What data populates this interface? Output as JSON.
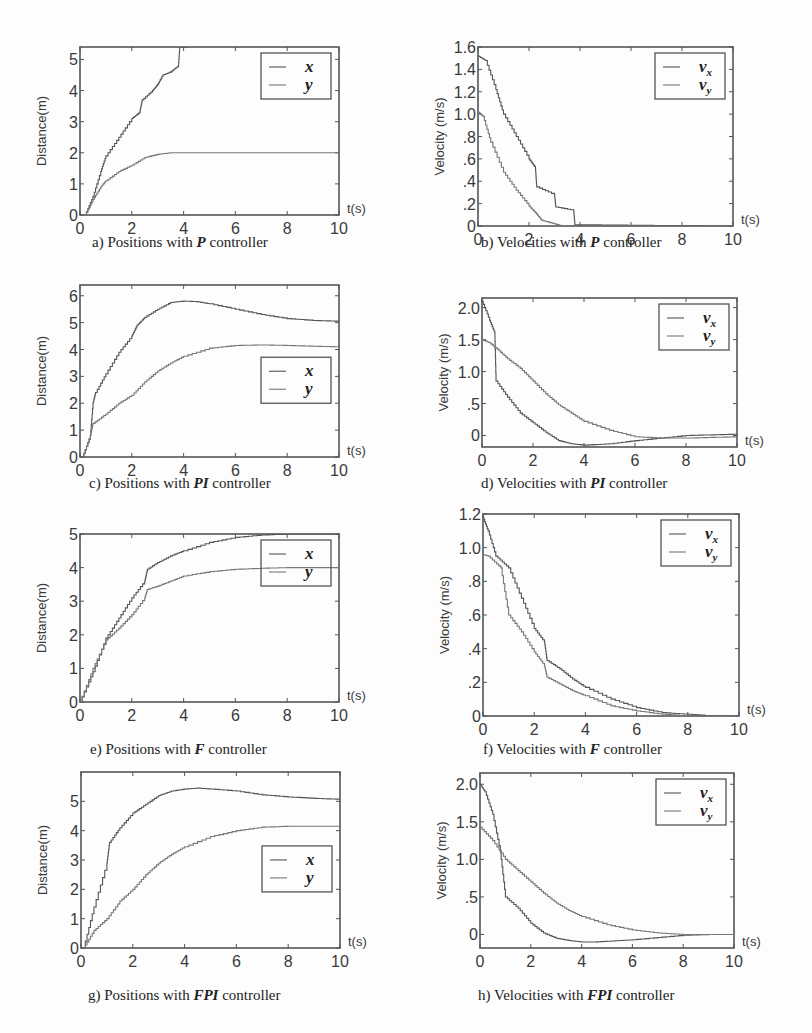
{
  "figure": {
    "colors": {
      "axis": "#555555",
      "curve_x": "#555555",
      "curve_y": "#777777",
      "background": "#fdfdfd"
    }
  },
  "chart_data": [
    {
      "id": "a",
      "type": "line",
      "title": "",
      "caption_prefix": "a) Positions with ",
      "caption_em": "P",
      "caption_suffix": " controller",
      "xlabel": "t(s)",
      "ylabel": "Distance(m)",
      "xlim": [
        0,
        10
      ],
      "ylim": [
        0,
        5.4
      ],
      "xticks": [
        0,
        2,
        4,
        6,
        8,
        10
      ],
      "yticks": [
        0,
        1,
        2,
        3,
        4,
        5
      ],
      "ytick_labels": [
        "0",
        "1",
        "2",
        "3",
        "4",
        "5"
      ],
      "grid": false,
      "legend": {
        "entries": [
          "x",
          "y"
        ],
        "position": "upper-right"
      },
      "series": [
        {
          "name": "x",
          "x": [
            0.2,
            0.5,
            0.8,
            1.0,
            1.5,
            2.0,
            2.3,
            2.4,
            2.8,
            3.0,
            3.2,
            3.5,
            3.8,
            3.85,
            4.2
          ],
          "y": [
            0,
            0.6,
            1.4,
            1.9,
            2.5,
            3.1,
            3.3,
            3.7,
            4.0,
            4.2,
            4.5,
            4.6,
            4.8,
            5.4,
            5.4
          ]
        },
        {
          "name": "y",
          "x": [
            0.2,
            0.5,
            0.8,
            1.0,
            1.5,
            2.0,
            2.5,
            3.0,
            3.5,
            4.0,
            6.0,
            8.0,
            10.0
          ],
          "y": [
            0,
            0.5,
            0.9,
            1.1,
            1.4,
            1.6,
            1.85,
            1.95,
            2.0,
            2.0,
            2.0,
            2.0,
            2.0
          ]
        }
      ]
    },
    {
      "id": "b",
      "type": "line",
      "caption_prefix": "b) Velocities with ",
      "caption_em": "P",
      "caption_suffix": " controller",
      "xlabel": "t(s)",
      "ylabel": "Velocity (m/s)",
      "xlim": [
        0,
        10
      ],
      "ylim": [
        0,
        1.6
      ],
      "xticks": [
        0,
        2,
        4,
        6,
        8,
        10
      ],
      "yticks": [
        0,
        0.2,
        0.4,
        0.6,
        0.8,
        1.0,
        1.2,
        1.4,
        1.6
      ],
      "ytick_labels": [
        "0",
        ".2",
        ".4",
        ".6",
        ".8",
        "1.0",
        "1.2",
        "1.4",
        "1.6"
      ],
      "grid": false,
      "legend": {
        "entries": [
          "v_x",
          "v_y"
        ],
        "position": "upper-right"
      },
      "series": [
        {
          "name": "v_x",
          "x": [
            0,
            0.3,
            0.7,
            1.0,
            1.5,
            2.0,
            2.25,
            2.3,
            3.0,
            3.05,
            3.75,
            3.8,
            10.0
          ],
          "y": [
            1.52,
            1.48,
            1.22,
            1.0,
            0.8,
            0.6,
            0.52,
            0.35,
            0.28,
            0.17,
            0.14,
            0.01,
            0.0
          ]
        },
        {
          "name": "v_y",
          "x": [
            0,
            0.2,
            0.5,
            1.0,
            1.5,
            2.0,
            2.25,
            2.5,
            3.0,
            3.3,
            10.0
          ],
          "y": [
            1.02,
            0.98,
            0.75,
            0.48,
            0.32,
            0.18,
            0.12,
            0.05,
            0.02,
            0.0,
            0.0
          ]
        }
      ]
    },
    {
      "id": "c",
      "type": "line",
      "caption_prefix": "c) Positions with ",
      "caption_em": "PI",
      "caption_suffix": " controller",
      "xlabel": "t(s)",
      "ylabel": "Distance(m)",
      "xlim": [
        0,
        10
      ],
      "ylim": [
        0,
        6.4
      ],
      "xticks": [
        0,
        2,
        4,
        6,
        8,
        10
      ],
      "yticks": [
        0,
        1,
        2,
        3,
        4,
        5,
        6
      ],
      "ytick_labels": [
        "0",
        "1",
        "2",
        "3",
        "4",
        "5",
        "6"
      ],
      "grid": false,
      "legend": {
        "entries": [
          "x",
          "y"
        ],
        "position": "center-right"
      },
      "series": [
        {
          "name": "x",
          "x": [
            0.1,
            0.4,
            0.5,
            0.6,
            1.0,
            1.5,
            2.0,
            2.2,
            2.5,
            3.0,
            3.5,
            4.0,
            4.5,
            5.0,
            6.0,
            7.0,
            8.0,
            9.0,
            10.0
          ],
          "y": [
            0,
            0.8,
            2.0,
            2.4,
            3.1,
            3.9,
            4.5,
            4.9,
            5.2,
            5.5,
            5.75,
            5.8,
            5.78,
            5.7,
            5.5,
            5.3,
            5.15,
            5.08,
            5.05
          ]
        },
        {
          "name": "y",
          "x": [
            0.1,
            0.4,
            0.5,
            1.0,
            1.5,
            2.0,
            2.5,
            3.0,
            3.5,
            4.0,
            5.0,
            6.0,
            7.0,
            8.0,
            9.0,
            10.0
          ],
          "y": [
            0,
            0.8,
            1.25,
            1.6,
            2.0,
            2.3,
            2.8,
            3.2,
            3.5,
            3.75,
            4.05,
            4.15,
            4.17,
            4.15,
            4.12,
            4.1
          ]
        }
      ]
    },
    {
      "id": "d",
      "type": "line",
      "caption_prefix": "d) Velocities with ",
      "caption_em": "PI",
      "caption_suffix": " controller",
      "xlabel": "t(s)",
      "ylabel": "Velocity (m/s)",
      "xlim": [
        0,
        10
      ],
      "ylim": [
        -0.18,
        2.15
      ],
      "xticks": [
        0,
        2,
        4,
        6,
        8,
        10
      ],
      "yticks": [
        0,
        0.5,
        1.0,
        1.5,
        2.0
      ],
      "ytick_labels": [
        "0",
        ".5",
        "1.0",
        "1.5",
        "2.0"
      ],
      "grid": false,
      "legend": {
        "entries": [
          "v_x",
          "v_y"
        ],
        "position": "upper-right"
      },
      "series": [
        {
          "name": "v_x",
          "x": [
            0,
            0.3,
            0.5,
            0.55,
            1.0,
            1.5,
            2.0,
            2.5,
            3.0,
            3.5,
            4.0,
            5.0,
            6.0,
            7.0,
            8.0,
            9.0,
            10.0
          ],
          "y": [
            2.1,
            1.8,
            1.6,
            0.85,
            0.6,
            0.35,
            0.2,
            0.05,
            -0.08,
            -0.13,
            -0.15,
            -0.13,
            -0.08,
            -0.04,
            0.0,
            0.01,
            0.02
          ]
        },
        {
          "name": "v_y",
          "x": [
            0,
            0.3,
            0.6,
            1.0,
            1.5,
            2.0,
            2.5,
            3.0,
            3.5,
            4.0,
            5.0,
            6.0,
            7.0,
            8.0,
            9.0,
            10.0
          ],
          "y": [
            1.5,
            1.45,
            1.35,
            1.2,
            1.05,
            0.85,
            0.65,
            0.48,
            0.35,
            0.22,
            0.08,
            -0.02,
            -0.04,
            -0.04,
            -0.03,
            -0.02
          ]
        }
      ]
    },
    {
      "id": "e",
      "type": "line",
      "caption_prefix": "e) Positions with  ",
      "caption_em": "F",
      "caption_suffix": " controller",
      "xlabel": "t(s)",
      "ylabel": "Distance(m)",
      "xlim": [
        0,
        10
      ],
      "ylim": [
        0,
        5.0
      ],
      "xticks": [
        0,
        2,
        4,
        6,
        8,
        10
      ],
      "yticks": [
        0,
        1,
        2,
        3,
        4,
        5
      ],
      "ytick_labels": [
        "0",
        "1",
        "2",
        "3",
        "4",
        "5"
      ],
      "grid": false,
      "legend": {
        "entries": [
          "x",
          "y"
        ],
        "position": "upper-right"
      },
      "series": [
        {
          "name": "x",
          "x": [
            0.0,
            0.5,
            1.0,
            1.5,
            2.0,
            2.5,
            2.6,
            3.0,
            3.5,
            4.0,
            5.0,
            6.0,
            7.0,
            8.0,
            9.0,
            10.0
          ],
          "y": [
            0,
            0.9,
            1.9,
            2.5,
            3.1,
            3.6,
            3.95,
            4.15,
            4.35,
            4.5,
            4.75,
            4.9,
            4.97,
            5.0,
            5.0,
            5.0
          ]
        },
        {
          "name": "y",
          "x": [
            0.0,
            0.5,
            1.0,
            1.5,
            2.0,
            2.5,
            2.6,
            3.0,
            3.5,
            4.0,
            5.0,
            6.0,
            7.0,
            8.0,
            9.0,
            10.0
          ],
          "y": [
            0,
            1.0,
            1.85,
            2.2,
            2.6,
            3.1,
            3.35,
            3.45,
            3.6,
            3.75,
            3.88,
            3.95,
            3.98,
            4.0,
            4.0,
            4.0
          ]
        }
      ]
    },
    {
      "id": "f",
      "type": "line",
      "caption_prefix": "f) Velocities with ",
      "caption_em": "F",
      "caption_suffix": " controller",
      "xlabel": "t(s)",
      "ylabel": "Velocity (m/s)",
      "xlim": [
        0,
        10
      ],
      "ylim": [
        0,
        1.2
      ],
      "xticks": [
        0,
        2,
        4,
        6,
        8,
        10
      ],
      "yticks": [
        0,
        0.2,
        0.4,
        0.6,
        0.8,
        1.0,
        1.2
      ],
      "ytick_labels": [
        "0",
        ".2",
        ".4",
        ".6",
        ".8",
        "1.0",
        "1.2"
      ],
      "grid": false,
      "legend": {
        "entries": [
          "v_x",
          "v_y"
        ],
        "position": "upper-right"
      },
      "series": [
        {
          "name": "v_x",
          "x": [
            0,
            0.2,
            0.5,
            1.0,
            1.5,
            2.0,
            2.4,
            2.5,
            3.0,
            3.5,
            4.0,
            5.0,
            6.0,
            7.0,
            8.0,
            9.0,
            10.0
          ],
          "y": [
            1.18,
            1.1,
            0.95,
            0.88,
            0.7,
            0.52,
            0.44,
            0.33,
            0.28,
            0.22,
            0.17,
            0.1,
            0.05,
            0.02,
            0.01,
            0.0,
            0.0
          ]
        },
        {
          "name": "v_y",
          "x": [
            0,
            0.2,
            0.7,
            1.0,
            1.5,
            2.0,
            2.4,
            2.5,
            3.0,
            3.5,
            4.0,
            5.0,
            6.0,
            7.0,
            8.0,
            9.0,
            10.0
          ],
          "y": [
            0.96,
            0.95,
            0.88,
            0.6,
            0.5,
            0.38,
            0.3,
            0.23,
            0.19,
            0.15,
            0.12,
            0.06,
            0.03,
            0.01,
            0.0,
            0.0,
            0.0
          ]
        }
      ]
    },
    {
      "id": "g",
      "type": "line",
      "caption_prefix": "g) Positions with ",
      "caption_em": "FPI",
      "caption_suffix": " controller",
      "xlabel": "t(s)",
      "ylabel": "Distance(m)",
      "xlim": [
        0,
        10
      ],
      "ylim": [
        0,
        6.0
      ],
      "xticks": [
        0,
        2,
        4,
        6,
        8,
        10
      ],
      "yticks": [
        0,
        1,
        2,
        3,
        4,
        5
      ],
      "ytick_labels": [
        "0",
        "1",
        "2",
        "3",
        "4",
        "5"
      ],
      "grid": false,
      "legend": {
        "entries": [
          "x",
          "y"
        ],
        "position": "center-right"
      },
      "series": [
        {
          "name": "x",
          "x": [
            0.1,
            0.5,
            1.0,
            1.1,
            1.5,
            2.0,
            2.5,
            3.0,
            3.5,
            4.0,
            4.5,
            5.0,
            6.0,
            7.0,
            8.0,
            9.0,
            10.0
          ],
          "y": [
            0,
            1.4,
            2.9,
            3.6,
            4.1,
            4.6,
            4.9,
            5.2,
            5.35,
            5.42,
            5.45,
            5.42,
            5.35,
            5.22,
            5.15,
            5.1,
            5.07
          ]
        },
        {
          "name": "y",
          "x": [
            0.1,
            0.5,
            1.0,
            1.5,
            2.0,
            2.5,
            3.0,
            3.5,
            4.0,
            5.0,
            6.0,
            7.0,
            8.0,
            9.0,
            10.0
          ],
          "y": [
            0,
            0.6,
            1.0,
            1.6,
            2.0,
            2.5,
            2.9,
            3.2,
            3.45,
            3.8,
            4.0,
            4.12,
            4.15,
            4.15,
            4.15
          ]
        }
      ]
    },
    {
      "id": "h",
      "type": "line",
      "caption_prefix": "h) Velocities with ",
      "caption_em": "FPI",
      "caption_suffix": " controller",
      "xlabel": "t(s)",
      "ylabel": "Velocity (m/s)",
      "xlim": [
        0,
        10
      ],
      "ylim": [
        -0.18,
        2.15
      ],
      "xticks": [
        0,
        2,
        4,
        6,
        8,
        10
      ],
      "yticks": [
        0,
        0.5,
        1.0,
        1.5,
        2.0
      ],
      "ytick_labels": [
        "0",
        ".5",
        "1.0",
        "1.5",
        "2.0"
      ],
      "grid": false,
      "legend": {
        "entries": [
          "v_x",
          "v_y"
        ],
        "position": "upper-right"
      },
      "series": [
        {
          "name": "v_x",
          "x": [
            0,
            0.2,
            0.5,
            0.8,
            1.0,
            1.5,
            2.0,
            2.5,
            3.0,
            3.5,
            4.0,
            4.5,
            5.0,
            6.0,
            7.0,
            8.0,
            9.0,
            10.0
          ],
          "y": [
            2.0,
            1.9,
            1.6,
            1.1,
            0.5,
            0.35,
            0.15,
            0.02,
            -0.05,
            -0.08,
            -0.1,
            -0.1,
            -0.09,
            -0.07,
            -0.04,
            -0.01,
            0.0,
            0.0
          ]
        },
        {
          "name": "v_y",
          "x": [
            0,
            0.5,
            1.0,
            1.5,
            2.0,
            2.5,
            3.0,
            3.5,
            4.0,
            5.0,
            6.0,
            7.0,
            8.0,
            9.0,
            10.0
          ],
          "y": [
            1.43,
            1.25,
            1.0,
            0.85,
            0.7,
            0.55,
            0.42,
            0.32,
            0.24,
            0.13,
            0.06,
            0.02,
            0.0,
            0.0,
            0.0
          ]
        }
      ]
    }
  ]
}
